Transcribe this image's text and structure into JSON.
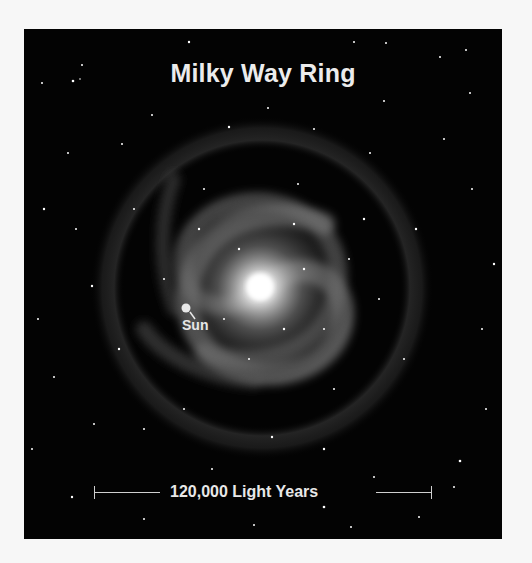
{
  "title": "Milky Way Ring",
  "sun_label": "Sun",
  "scale_label": "120,000 Light Years",
  "colors": {
    "background": "#f7f7f7",
    "panel": "#030303",
    "text": "#ececec",
    "galaxy_core": "#ffffff"
  }
}
